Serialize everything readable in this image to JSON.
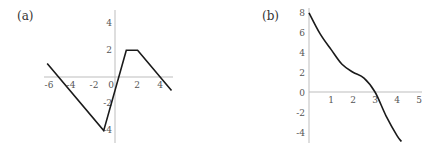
{
  "chart_data": [
    {
      "panel_label": "(a)",
      "type": "line",
      "title": "",
      "xlabel": "",
      "ylabel": "",
      "xlim": [
        -6.2,
        5.2
      ],
      "ylim": [
        -5,
        5
      ],
      "grid": false,
      "x_ticks": [
        -6,
        -4,
        -2,
        0,
        2,
        4
      ],
      "y_ticks": [
        4,
        2,
        -2,
        -4
      ],
      "x": [
        -6,
        -1,
        1,
        2,
        5
      ],
      "y": [
        1,
        -4,
        2,
        2,
        -1
      ]
    },
    {
      "panel_label": "(b)",
      "type": "line",
      "title": "",
      "xlabel": "",
      "ylabel": "",
      "xlim": [
        0,
        5
      ],
      "ylim": [
        -5,
        8
      ],
      "grid": false,
      "x_ticks": [
        1,
        2,
        3,
        4,
        5
      ],
      "y_ticks": [
        8,
        6,
        4,
        2,
        0,
        -2,
        -4
      ],
      "x": [
        0,
        0.5,
        1,
        1.5,
        2,
        2.5,
        3,
        3.5,
        4,
        4.2
      ],
      "y": [
        8,
        5.9,
        4.3,
        2.8,
        2,
        1.4,
        0,
        -2.4,
        -4.4,
        -5
      ]
    }
  ]
}
